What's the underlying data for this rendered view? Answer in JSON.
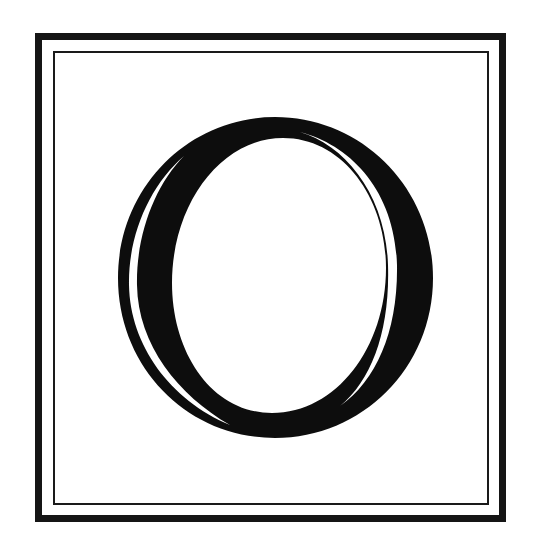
{
  "illustration": {
    "type": "decorative-initial",
    "letter": "O",
    "style": "engraved inline serif capital inside a double-ruled square frame",
    "colors": {
      "ink": "#0d0d0d",
      "paper": "#ffffff",
      "frame": "#151515"
    },
    "frame": {
      "outer_rule": "thick",
      "inner_rule": "thin"
    }
  }
}
